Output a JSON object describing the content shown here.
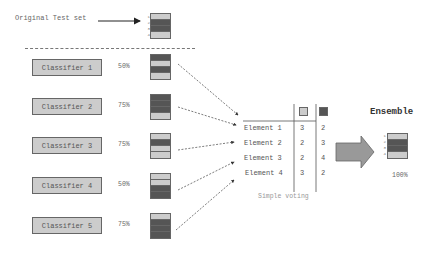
{
  "original": {
    "label": "Original Test set",
    "stack": [
      "light",
      "dark",
      "dark",
      "light"
    ],
    "indices": [
      "1",
      "2",
      "3",
      "4"
    ]
  },
  "classifiers": [
    {
      "label": "Classifier 1",
      "accuracy": "50%",
      "stack": [
        "dark",
        "light",
        "dark",
        "light"
      ]
    },
    {
      "label": "Classifier 2",
      "accuracy": "75%",
      "stack": [
        "dark",
        "dark",
        "dark",
        "light"
      ]
    },
    {
      "label": "Classifier 3",
      "accuracy": "75%",
      "stack": [
        "light",
        "dark",
        "light",
        "light"
      ]
    },
    {
      "label": "Classifier 4",
      "accuracy": "50%",
      "stack": [
        "light",
        "light",
        "dark",
        "dark"
      ]
    },
    {
      "label": "Classifier 5",
      "accuracy": "75%",
      "stack": [
        "light",
        "dark",
        "dark",
        "dark"
      ]
    }
  ],
  "voting_table": {
    "legend": [
      {
        "color": "#cccccc",
        "name": "light-class"
      },
      {
        "color": "#555555",
        "name": "dark-class"
      }
    ],
    "rows": [
      {
        "label": "Element 1",
        "light": "3",
        "dark": "2"
      },
      {
        "label": "Element 2",
        "light": "2",
        "dark": "3"
      },
      {
        "label": "Element 3",
        "light": "2",
        "dark": "4"
      },
      {
        "label": "Element 4",
        "light": "3",
        "dark": "2"
      }
    ],
    "caption": "Simple voting"
  },
  "ensemble": {
    "title": "Ensemble",
    "accuracy": "100%",
    "stack": [
      "light",
      "dark",
      "dark",
      "light"
    ],
    "indices": [
      "1",
      "2",
      "3",
      "4"
    ]
  },
  "colors": {
    "light": "#cccccc",
    "dark": "#555555",
    "border": "#666666"
  }
}
